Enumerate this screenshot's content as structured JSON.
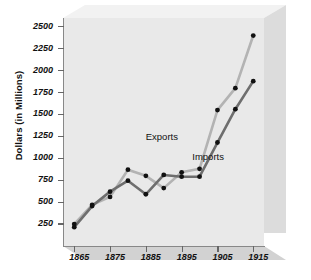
{
  "chart_data": {
    "type": "line",
    "title": "",
    "xlabel": "",
    "ylabel": "Dollars (in Millions)",
    "x": [
      1865,
      1870,
      1875,
      1880,
      1885,
      1890,
      1895,
      1900,
      1905,
      1910,
      1915
    ],
    "xtick_labels": [
      "1865",
      "1875",
      "1885",
      "1895",
      "1905",
      "1915"
    ],
    "xtick_values": [
      1865,
      1875,
      1885,
      1895,
      1905,
      1915
    ],
    "ytick_labels": [
      "250",
      "500",
      "750",
      "1000",
      "1250",
      "1500",
      "1750",
      "2000",
      "2250",
      "2500"
    ],
    "ytick_values": [
      250,
      500,
      750,
      1000,
      1250,
      1500,
      1750,
      2000,
      2250,
      2500
    ],
    "ylim": [
      0,
      2600
    ],
    "xlim": [
      1862,
      1918
    ],
    "grid": false,
    "legend_position": "inline-annotation",
    "series": [
      {
        "name": "Exports",
        "color": "#b3b3b3",
        "marker_color": "#111111",
        "values": [
          250,
          470,
          560,
          870,
          800,
          660,
          840,
          880,
          1550,
          1800,
          2400
        ]
      },
      {
        "name": "Imports",
        "color": "#6e6e6e",
        "marker_color": "#111111",
        "values": [
          215,
          455,
          620,
          745,
          590,
          810,
          790,
          790,
          1180,
          1560,
          1880
        ]
      }
    ],
    "annotations": [
      {
        "text": "Exports",
        "x": 1890,
        "y": 1240
      },
      {
        "text": "Imports",
        "x": 1903,
        "y": 1020
      }
    ]
  },
  "axis": {
    "y_title": "Dollars (in Millions)"
  },
  "colors": {
    "panel_face": "#e9e9e9",
    "panel_side": "#dcdcdc",
    "panel_top": "#f2f2f2",
    "panel_bottom": "#d2d2d2",
    "exports_line": "#b3b3b3",
    "imports_line": "#6e6e6e",
    "marker": "#111111",
    "axis": "#888888",
    "text": "#111111"
  }
}
